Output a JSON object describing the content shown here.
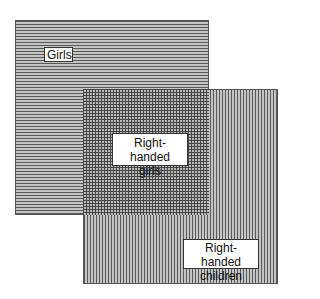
{
  "diagram": {
    "type": "venn-overlapping-squares",
    "sets": [
      {
        "id": "girls",
        "label": "Girls",
        "pattern": "horizontal-stripes"
      },
      {
        "id": "right-handed-children",
        "label_line1": "Right-handed",
        "label_line2": "children",
        "pattern": "vertical-stripes"
      }
    ],
    "intersection": {
      "label_line1": "Right-handed",
      "label_line2": "girls",
      "pattern": "crosshatch"
    }
  },
  "colors": {
    "stripe_dark": "#5a5a5a",
    "stripe_light": "#c4c4c4",
    "label_bg": "#ffffff",
    "background": "#ffffff"
  }
}
